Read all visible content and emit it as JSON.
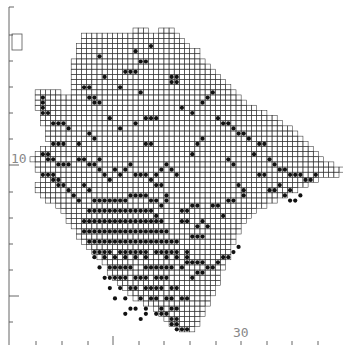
{
  "map": {
    "type": "grid-square distribution map",
    "grid": {
      "x0": 30,
      "y0": 28,
      "cell": 5.15,
      "line_color": "#333333",
      "dot_color": "#111111"
    },
    "axis": {
      "left": {
        "x": 9,
        "y_top": 7,
        "y_bottom": 345,
        "ticks_y": [
          35,
          61,
          87,
          113,
          139,
          165,
          192,
          218,
          244,
          270,
          296,
          322
        ],
        "long_ticks_y": [
          165,
          296
        ],
        "label": "10",
        "label_y": 158
      },
      "bottom": {
        "y": 338,
        "ticks_x": [
          36,
          62,
          88,
          113,
          139,
          164,
          190,
          216,
          241,
          267,
          292,
          318
        ],
        "long_ticks_x": [
          113
        ],
        "label": "30",
        "label_x": 233
      },
      "color": "#555555"
    },
    "inset_box": {
      "x": 12,
      "y": 34,
      "w": 10,
      "h": 16
    },
    "rows": [
      [
        [
          20,
          22
        ],
        [
          25,
          27
        ]
      ],
      [
        [
          10,
          28
        ]
      ],
      [
        [
          10,
          29
        ]
      ],
      [
        [
          9,
          30
        ]
      ],
      [
        [
          9,
          32
        ]
      ],
      [
        [
          9,
          32
        ]
      ],
      [
        [
          8,
          33
        ]
      ],
      [
        [
          8,
          34
        ]
      ],
      [
        [
          8,
          35
        ]
      ],
      [
        [
          8,
          36
        ]
      ],
      [
        [
          8,
          37
        ]
      ],
      [
        [
          8,
          38
        ]
      ],
      [
        [
          1,
          5
        ],
        [
          8,
          39
        ]
      ],
      [
        [
          1,
          40
        ]
      ],
      [
        [
          1,
          41
        ]
      ],
      [
        [
          1,
          43
        ]
      ],
      [
        [
          2,
          45
        ]
      ],
      [
        [
          2,
          47
        ]
      ],
      [
        [
          2,
          48
        ]
      ],
      [
        [
          3,
          50
        ]
      ],
      [
        [
          3,
          51
        ]
      ],
      [
        [
          3,
          52
        ]
      ],
      [
        [
          4,
          53
        ]
      ],
      [
        [
          2,
          54
        ]
      ],
      [
        [
          1,
          55
        ]
      ],
      [
        [
          0,
          56
        ]
      ],
      [
        [
          1,
          58
        ]
      ],
      [
        [
          1,
          60
        ]
      ],
      [
        [
          2,
          59
        ]
      ],
      [
        [
          2,
          55
        ]
      ],
      [
        [
          1,
          53
        ]
      ],
      [
        [
          1,
          51
        ]
      ],
      [
        [
          2,
          49
        ]
      ],
      [
        [
          3,
          47
        ]
      ],
      [
        [
          5,
          45
        ]
      ],
      [
        [
          6,
          43
        ]
      ],
      [
        [
          7,
          42
        ]
      ],
      [
        [
          7,
          41
        ]
      ],
      [
        [
          8,
          40
        ]
      ],
      [
        [
          9,
          40
        ]
      ],
      [
        [
          9,
          39
        ]
      ],
      [
        [
          10,
          39
        ]
      ],
      [
        [
          11,
          38
        ]
      ],
      [
        [
          12,
          38
        ]
      ],
      [
        [
          13,
          38
        ]
      ],
      [
        [
          14,
          37
        ]
      ],
      [
        [
          15,
          37
        ]
      ],
      [
        [
          15,
          36
        ]
      ],
      [
        [
          16,
          36
        ]
      ],
      [
        [
          17,
          36
        ]
      ],
      [
        [
          18,
          35
        ]
      ],
      [
        [
          19,
          35
        ]
      ],
      [
        [
          20,
          34
        ]
      ],
      [
        [
          22,
          34
        ]
      ],
      [
        [
          24,
          33
        ]
      ],
      [
        [
          25,
          33
        ]
      ],
      [
        [
          26,
          32
        ]
      ],
      [
        [
          27,
          32
        ]
      ],
      [
        [
          29,
          31
        ]
      ]
    ],
    "dots": [
      [
        20,
        4
      ],
      [
        21,
        6
      ],
      [
        22,
        6
      ],
      [
        23,
        3
      ],
      [
        18,
        8
      ],
      [
        19,
        8
      ],
      [
        20,
        8
      ],
      [
        17,
        11
      ],
      [
        23,
        17
      ],
      [
        24,
        17
      ],
      [
        22,
        17
      ],
      [
        21,
        12
      ],
      [
        27,
        9
      ],
      [
        28,
        9
      ],
      [
        28,
        10
      ],
      [
        27,
        10
      ],
      [
        22,
        22
      ],
      [
        23,
        22
      ],
      [
        13,
        5
      ],
      [
        14,
        9
      ],
      [
        11,
        13
      ],
      [
        12,
        13
      ],
      [
        12,
        14
      ],
      [
        13,
        14
      ],
      [
        10,
        11
      ],
      [
        11,
        11
      ],
      [
        15,
        17
      ],
      [
        17,
        19
      ],
      [
        20,
        18
      ],
      [
        29,
        15
      ],
      [
        31,
        16
      ],
      [
        33,
        14
      ],
      [
        34,
        13
      ],
      [
        35,
        12
      ],
      [
        36,
        17
      ],
      [
        37,
        18
      ],
      [
        38,
        18
      ],
      [
        39,
        19
      ],
      [
        40,
        20
      ],
      [
        41,
        20
      ],
      [
        42,
        21
      ],
      [
        44,
        22
      ],
      [
        45,
        22
      ],
      [
        43,
        24
      ],
      [
        46,
        25
      ],
      [
        47,
        26
      ],
      [
        48,
        27
      ],
      [
        49,
        27
      ],
      [
        50,
        28
      ],
      [
        51,
        28
      ],
      [
        52,
        28
      ],
      [
        53,
        29
      ],
      [
        54,
        29
      ],
      [
        55,
        28
      ],
      [
        44,
        28
      ],
      [
        45,
        28
      ],
      [
        46,
        31
      ],
      [
        47,
        31
      ],
      [
        48,
        30
      ],
      [
        49,
        32
      ],
      [
        50,
        31
      ],
      [
        50,
        33
      ],
      [
        51,
        33
      ],
      [
        52,
        32
      ],
      [
        40,
        30
      ],
      [
        41,
        31
      ],
      [
        41,
        32
      ],
      [
        38,
        33
      ],
      [
        39,
        33
      ],
      [
        35,
        34
      ],
      [
        36,
        34
      ],
      [
        37,
        36
      ],
      [
        34,
        38
      ],
      [
        32,
        40
      ],
      [
        33,
        40
      ],
      [
        38,
        25
      ],
      [
        39,
        26
      ],
      [
        31,
        24
      ],
      [
        32,
        22
      ],
      [
        33,
        21
      ],
      [
        28,
        28
      ],
      [
        27,
        27
      ],
      [
        26,
        26
      ],
      [
        25,
        27
      ],
      [
        24,
        30
      ],
      [
        25,
        30
      ],
      [
        26,
        32
      ],
      [
        26,
        33
      ],
      [
        2,
        13
      ],
      [
        2,
        14
      ],
      [
        2,
        15
      ],
      [
        2,
        16
      ],
      [
        3,
        16
      ],
      [
        4,
        18
      ],
      [
        5,
        18
      ],
      [
        6,
        18
      ],
      [
        7,
        19
      ],
      [
        4,
        22
      ],
      [
        5,
        22
      ],
      [
        6,
        22
      ],
      [
        9,
        22
      ],
      [
        11,
        20
      ],
      [
        12,
        21
      ],
      [
        13,
        25
      ],
      [
        2,
        24
      ],
      [
        3,
        24
      ],
      [
        3,
        25
      ],
      [
        4,
        25
      ],
      [
        5,
        26
      ],
      [
        6,
        26
      ],
      [
        7,
        26
      ],
      [
        2,
        28
      ],
      [
        3,
        28
      ],
      [
        4,
        28
      ],
      [
        4,
        29
      ],
      [
        5,
        29
      ],
      [
        5,
        30
      ],
      [
        6,
        30
      ],
      [
        7,
        31
      ],
      [
        8,
        32
      ],
      [
        9,
        33
      ],
      [
        10,
        30
      ],
      [
        11,
        31
      ],
      [
        9,
        25
      ],
      [
        10,
        25
      ],
      [
        11,
        26
      ],
      [
        12,
        26
      ],
      [
        13,
        27
      ],
      [
        14,
        28
      ],
      [
        15,
        29
      ],
      [
        16,
        27
      ],
      [
        17,
        28
      ],
      [
        18,
        27
      ],
      [
        19,
        26
      ],
      [
        20,
        28
      ],
      [
        21,
        28
      ],
      [
        22,
        28
      ],
      [
        23,
        29
      ],
      [
        24,
        28
      ],
      [
        12,
        33
      ],
      [
        13,
        33
      ],
      [
        14,
        33
      ],
      [
        15,
        33
      ],
      [
        16,
        33
      ],
      [
        17,
        33
      ],
      [
        18,
        33
      ],
      [
        19,
        32
      ],
      [
        20,
        32
      ],
      [
        21,
        32
      ],
      [
        22,
        32
      ],
      [
        23,
        33
      ],
      [
        24,
        33
      ],
      [
        25,
        34
      ],
      [
        11,
        35
      ],
      [
        12,
        35
      ],
      [
        13,
        35
      ],
      [
        14,
        35
      ],
      [
        15,
        35
      ],
      [
        16,
        35
      ],
      [
        17,
        35
      ],
      [
        18,
        35
      ],
      [
        19,
        35
      ],
      [
        20,
        35
      ],
      [
        21,
        35
      ],
      [
        22,
        35
      ],
      [
        23,
        35
      ],
      [
        24,
        36
      ],
      [
        10,
        37
      ],
      [
        11,
        37
      ],
      [
        12,
        37
      ],
      [
        13,
        37
      ],
      [
        14,
        37
      ],
      [
        15,
        37
      ],
      [
        16,
        37
      ],
      [
        17,
        37
      ],
      [
        18,
        37
      ],
      [
        19,
        37
      ],
      [
        20,
        37
      ],
      [
        21,
        37
      ],
      [
        22,
        37
      ],
      [
        23,
        37
      ],
      [
        24,
        37
      ],
      [
        25,
        37
      ],
      [
        10,
        39
      ],
      [
        11,
        39
      ],
      [
        12,
        39
      ],
      [
        13,
        39
      ],
      [
        14,
        39
      ],
      [
        15,
        39
      ],
      [
        16,
        39
      ],
      [
        17,
        39
      ],
      [
        18,
        39
      ],
      [
        19,
        39
      ],
      [
        20,
        39
      ],
      [
        21,
        39
      ],
      [
        22,
        39
      ],
      [
        23,
        39
      ],
      [
        24,
        39
      ],
      [
        25,
        39
      ],
      [
        26,
        39
      ],
      [
        11,
        41
      ],
      [
        12,
        41
      ],
      [
        13,
        41
      ],
      [
        14,
        41
      ],
      [
        15,
        41
      ],
      [
        16,
        41
      ],
      [
        17,
        41
      ],
      [
        18,
        41
      ],
      [
        19,
        41
      ],
      [
        20,
        41
      ],
      [
        21,
        41
      ],
      [
        22,
        41
      ],
      [
        23,
        41
      ],
      [
        24,
        41
      ],
      [
        25,
        41
      ],
      [
        26,
        41
      ],
      [
        27,
        41
      ],
      [
        28,
        41
      ],
      [
        12,
        43
      ],
      [
        13,
        43
      ],
      [
        14,
        43
      ],
      [
        15,
        43
      ],
      [
        17,
        43
      ],
      [
        18,
        43
      ],
      [
        19,
        43
      ],
      [
        20,
        43
      ],
      [
        21,
        43
      ],
      [
        22,
        43
      ],
      [
        24,
        43
      ],
      [
        25,
        43
      ],
      [
        26,
        43
      ],
      [
        27,
        43
      ],
      [
        28,
        43
      ],
      [
        30,
        43
      ],
      [
        12,
        44
      ],
      [
        14,
        44
      ],
      [
        16,
        44
      ],
      [
        18,
        44
      ],
      [
        20,
        44
      ],
      [
        22,
        44
      ],
      [
        26,
        44
      ],
      [
        28,
        44
      ],
      [
        30,
        44
      ],
      [
        13,
        46
      ],
      [
        15,
        46
      ],
      [
        16,
        46
      ],
      [
        17,
        46
      ],
      [
        18,
        46
      ],
      [
        19,
        46
      ],
      [
        22,
        46
      ],
      [
        23,
        46
      ],
      [
        24,
        46
      ],
      [
        25,
        46
      ],
      [
        26,
        46
      ],
      [
        27,
        46
      ],
      [
        29,
        46
      ],
      [
        14,
        48
      ],
      [
        15,
        48
      ],
      [
        16,
        48
      ],
      [
        17,
        48
      ],
      [
        18,
        48
      ],
      [
        20,
        48
      ],
      [
        21,
        48
      ],
      [
        22,
        48
      ],
      [
        24,
        48
      ],
      [
        25,
        48
      ],
      [
        26,
        48
      ],
      [
        15,
        50
      ],
      [
        17,
        50
      ],
      [
        19,
        50
      ],
      [
        20,
        50
      ],
      [
        22,
        50
      ],
      [
        23,
        50
      ],
      [
        24,
        50
      ],
      [
        25,
        50
      ],
      [
        27,
        50
      ],
      [
        28,
        50
      ],
      [
        16,
        52
      ],
      [
        18,
        52
      ],
      [
        21,
        52
      ],
      [
        23,
        52
      ],
      [
        24,
        52
      ],
      [
        26,
        52
      ],
      [
        27,
        52
      ],
      [
        29,
        52
      ],
      [
        30,
        52
      ],
      [
        19,
        54
      ],
      [
        20,
        54
      ],
      [
        22,
        54
      ],
      [
        25,
        54
      ],
      [
        27,
        54
      ],
      [
        28,
        54
      ],
      [
        21,
        56
      ],
      [
        27,
        56
      ],
      [
        28,
        56
      ],
      [
        27,
        57
      ],
      [
        28,
        57
      ],
      [
        28,
        58
      ],
      [
        29,
        58
      ],
      [
        30,
        58
      ],
      [
        24,
        55
      ],
      [
        25,
        55
      ],
      [
        26,
        55
      ],
      [
        22,
        55
      ],
      [
        18,
        55
      ],
      [
        31,
        48
      ],
      [
        32,
        47
      ],
      [
        33,
        47
      ],
      [
        34,
        46
      ],
      [
        35,
        46
      ],
      [
        36,
        45
      ],
      [
        37,
        44
      ],
      [
        38,
        44
      ],
      [
        39,
        43
      ],
      [
        40,
        42
      ],
      [
        30,
        45
      ],
      [
        31,
        45
      ],
      [
        32,
        45
      ],
      [
        33,
        45
      ],
      [
        31,
        40
      ],
      [
        32,
        38
      ],
      [
        33,
        37
      ],
      [
        29,
        35
      ],
      [
        30,
        35
      ],
      [
        31,
        34
      ],
      [
        32,
        34
      ],
      [
        29,
        37
      ],
      [
        30,
        37
      ]
    ]
  }
}
